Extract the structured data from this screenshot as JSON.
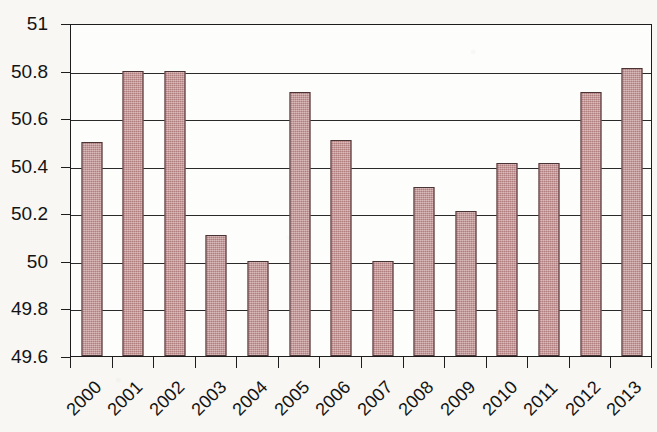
{
  "chart_data": {
    "type": "bar",
    "title": "",
    "subtitle": "",
    "xlabel": "",
    "ylabel": "",
    "categories": [
      "2000",
      "2001",
      "2002",
      "2003",
      "2004",
      "2005",
      "2006",
      "2007",
      "2008",
      "2009",
      "2010",
      "2011",
      "2012",
      "2013"
    ],
    "values": [
      50.5,
      50.8,
      50.8,
      50.11,
      50.0,
      50.71,
      50.51,
      50.0,
      50.31,
      50.21,
      50.41,
      50.41,
      50.71,
      50.81
    ],
    "series": [
      {
        "name": "",
        "values": [
          50.5,
          50.8,
          50.8,
          50.11,
          50.0,
          50.71,
          50.51,
          50.0,
          50.31,
          50.21,
          50.41,
          50.41,
          50.71,
          50.81
        ]
      }
    ],
    "ylim": [
      49.6,
      51.0
    ],
    "ytick_labels": [
      "51",
      "50.8",
      "50.6",
      "50.4",
      "50.2",
      "50",
      "49.8",
      "49.6"
    ],
    "ytick_values": [
      51,
      50.8,
      50.6,
      50.4,
      50.2,
      50,
      49.8,
      49.6
    ],
    "xtick_labels": [
      "2000",
      "2001",
      "2002",
      "2003",
      "2004",
      "2005",
      "2006",
      "2007",
      "2008",
      "2009",
      "2010",
      "2011",
      "2012",
      "2013"
    ],
    "xtick_label_rotation_deg": -45,
    "grid": "horizontal",
    "legend": "none",
    "annotations": [],
    "colors": {
      "bar_fill": "#c08d8d",
      "bar_border": "#4a3335",
      "gridline": "#2a2a2a",
      "axis": "#1d1d1d",
      "plot_background": "#fdfdfb",
      "page_background": "#f8f7f3",
      "text": "#131313"
    }
  }
}
